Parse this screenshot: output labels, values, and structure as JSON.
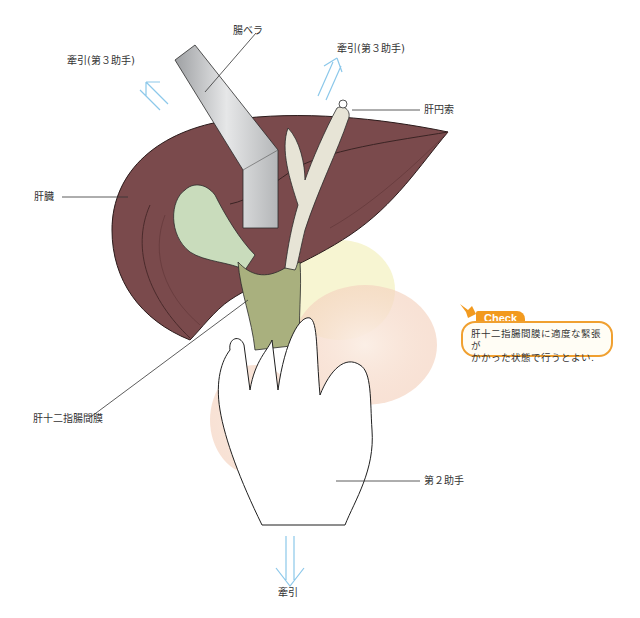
{
  "figure": {
    "labels": {
      "traction_3rd_left": "牽引(第３助手)",
      "intestinal_spatula": "腸ベラ",
      "traction_3rd_right": "牽引(第３助手)",
      "round_ligament": "肝円索",
      "liver": "肝臓",
      "hepatoduodenal_ligament": "肝十二指腸間膜",
      "second_assistant": "第２助手",
      "traction_bottom": "牽引"
    },
    "callout": {
      "tag": "Check",
      "line1": "肝十二指腸間膜に適度な緊張が",
      "line2": "かかった状態で行うとよい."
    },
    "colors": {
      "liver": "#7a4a4c",
      "liver_dark": "#5e3436",
      "gallbladder": "#c9dcbc",
      "ligament": "#a9b07e",
      "retractor": "#c8c9cb",
      "arrow": "#8cc8ea",
      "duodenum": "#f6e2d6",
      "pancreas": "#f6f4d0",
      "callout_accent": "#f29a1f"
    }
  }
}
